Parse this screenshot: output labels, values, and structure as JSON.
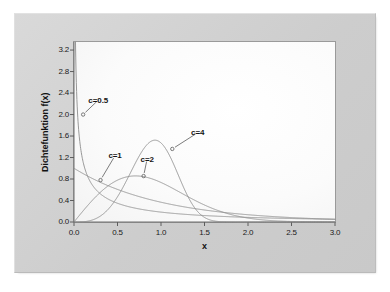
{
  "chart_data": {
    "type": "line",
    "title": "",
    "xlabel": "x",
    "ylabel": "Dichtefunktion f(x)",
    "xlim": [
      0.0,
      3.0
    ],
    "ylim": [
      0.0,
      3.35
    ],
    "grid": false,
    "legend_position": "inline-annotations",
    "xticks": [
      "0.0",
      "0.5",
      "1.0",
      "1.5",
      "2.0",
      "2.5",
      "3.0"
    ],
    "xtick_values": [
      0.0,
      0.5,
      1.0,
      1.5,
      2.0,
      2.5,
      3.0
    ],
    "yticks": [
      "0.0",
      "0.4",
      "0.8",
      "1.2",
      "1.6",
      "2.0",
      "2.4",
      "2.8",
      "3.2"
    ],
    "ytick_values": [
      0.0,
      0.4,
      0.8,
      1.2,
      1.6,
      2.0,
      2.4,
      2.8,
      3.2
    ],
    "distribution": "weibull",
    "scale": 1.0,
    "series": [
      {
        "name": "c=0.5",
        "shape": 0.5,
        "label": "c=0.5",
        "label_x": 0.28,
        "label_y": 2.27,
        "anchor_x": 0.105,
        "anchor_y": 2.0,
        "color": "#8c8c8c",
        "x": [
          0.01,
          0.02,
          0.04,
          0.06,
          0.1,
          0.15,
          0.2,
          0.3,
          0.4,
          0.5,
          0.7,
          1.0,
          1.5,
          2.0,
          2.5,
          3.0
        ],
        "y": [
          4.54,
          3.17,
          2.18,
          1.75,
          1.32,
          1.04,
          0.87,
          0.66,
          0.53,
          0.45,
          0.33,
          0.22,
          0.12,
          0.07,
          0.04,
          0.03
        ]
      },
      {
        "name": "c=1",
        "shape": 1.0,
        "label": "c=1",
        "label_x": 0.47,
        "label_y": 1.23,
        "anchor_x": 0.305,
        "anchor_y": 0.78,
        "color": "#8c8c8c",
        "x": [
          0.0,
          0.25,
          0.5,
          0.75,
          1.0,
          1.25,
          1.5,
          2.0,
          2.5,
          3.0
        ],
        "y": [
          1.0,
          0.78,
          0.61,
          0.47,
          0.37,
          0.29,
          0.22,
          0.14,
          0.08,
          0.05
        ]
      },
      {
        "name": "c=2",
        "shape": 2.0,
        "label": "c=2",
        "label_x": 0.84,
        "label_y": 1.17,
        "anchor_x": 0.8,
        "anchor_y": 0.855,
        "color": "#8c8c8c",
        "peak_x": 0.707,
        "peak_y": 0.858,
        "x": [
          0.0,
          0.25,
          0.5,
          0.707,
          1.0,
          1.25,
          1.5,
          2.0,
          2.5,
          3.0
        ],
        "y": [
          0.0,
          0.47,
          0.78,
          0.858,
          0.74,
          0.52,
          0.32,
          0.07,
          0.01,
          0.0
        ]
      },
      {
        "name": "c=4",
        "shape": 4.0,
        "label": "c=4",
        "label_x": 1.42,
        "label_y": 1.66,
        "anchor_x": 1.13,
        "anchor_y": 1.36,
        "color": "#8c8c8c",
        "peak_x": 0.931,
        "peak_y": 1.52,
        "x": [
          0.0,
          0.25,
          0.5,
          0.75,
          0.931,
          1.1,
          1.25,
          1.5,
          1.75,
          2.0,
          2.5,
          3.0
        ],
        "y": [
          0.0,
          0.06,
          0.49,
          1.19,
          1.52,
          1.36,
          0.96,
          0.26,
          0.02,
          0.0,
          0.0,
          0.0
        ]
      }
    ]
  }
}
